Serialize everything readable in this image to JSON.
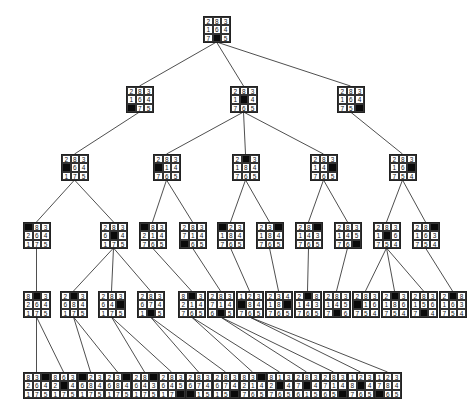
{
  "colors": {
    "blank_tile": "#0a0a0a",
    "line": "#222222",
    "background": "#ffffff"
  },
  "nodes": [
    {
      "id": "r",
      "x": 203,
      "y": 16,
      "tiles": "283164705"
    },
    {
      "id": "a",
      "x": 126,
      "y": 86,
      "tiles": "283164075"
    },
    {
      "id": "b",
      "x": 230,
      "y": 86,
      "tiles": "283104765"
    },
    {
      "id": "c",
      "x": 337,
      "y": 86,
      "tiles": "283164750"
    },
    {
      "id": "a1",
      "x": 61,
      "y": 154,
      "tiles": "283064175"
    },
    {
      "id": "b1",
      "x": 153,
      "y": 154,
      "tiles": "283014765"
    },
    {
      "id": "b2",
      "x": 232,
      "y": 154,
      "tiles": "203184765"
    },
    {
      "id": "b3",
      "x": 310,
      "y": 154,
      "tiles": "283140765"
    },
    {
      "id": "c1",
      "x": 389,
      "y": 154,
      "tiles": "283160754"
    },
    {
      "id": "a1a",
      "x": 23,
      "y": 222,
      "tiles": "083264175"
    },
    {
      "id": "a1b",
      "x": 100,
      "y": 222,
      "tiles": "283604175"
    },
    {
      "id": "b1a",
      "x": 139,
      "y": 222,
      "tiles": "083214765"
    },
    {
      "id": "b1b",
      "x": 179,
      "y": 222,
      "tiles": "283714065"
    },
    {
      "id": "b2a",
      "x": 217,
      "y": 222,
      "tiles": "023184765"
    },
    {
      "id": "b2b",
      "x": 256,
      "y": 222,
      "tiles": "230184765"
    },
    {
      "id": "b3a",
      "x": 295,
      "y": 222,
      "tiles": "280143765"
    },
    {
      "id": "b3b",
      "x": 334,
      "y": 222,
      "tiles": "283145760"
    },
    {
      "id": "c1a",
      "x": 373,
      "y": 222,
      "tiles": "283106754"
    },
    {
      "id": "c1b",
      "x": 412,
      "y": 222,
      "tiles": "280163754"
    },
    {
      "id": "d1",
      "x": 23,
      "y": 291,
      "tiles": "803264175"
    },
    {
      "id": "d2",
      "x": 60,
      "y": 291,
      "tiles": "203684175"
    },
    {
      "id": "d3",
      "x": 98,
      "y": 291,
      "tiles": "283640175"
    },
    {
      "id": "d4",
      "x": 137,
      "y": 291,
      "tiles": "283674105"
    },
    {
      "id": "d5",
      "x": 178,
      "y": 291,
      "tiles": "803214765"
    },
    {
      "id": "d6",
      "x": 207,
      "y": 291,
      "tiles": "283714605"
    },
    {
      "id": "d7",
      "x": 236,
      "y": 291,
      "tiles": "123084765"
    },
    {
      "id": "d8",
      "x": 265,
      "y": 291,
      "tiles": "234180765"
    },
    {
      "id": "d9",
      "x": 294,
      "y": 291,
      "tiles": "208143765"
    },
    {
      "id": "d10",
      "x": 323,
      "y": 291,
      "tiles": "283145706"
    },
    {
      "id": "d11",
      "x": 352,
      "y": 291,
      "tiles": "283016754"
    },
    {
      "id": "d12",
      "x": 381,
      "y": 291,
      "tiles": "203186754"
    },
    {
      "id": "d13",
      "x": 410,
      "y": 291,
      "tiles": "283156704"
    },
    {
      "id": "d14",
      "x": 439,
      "y": 291,
      "tiles": "208163754"
    },
    {
      "id": "e1",
      "x": 23,
      "y": 372,
      "tiles": "830264175"
    },
    {
      "id": "e2",
      "x": 50,
      "y": 372,
      "tiles": "863204175"
    },
    {
      "id": "e3",
      "x": 77,
      "y": 372,
      "tiles": "023684175"
    },
    {
      "id": "e4",
      "x": 104,
      "y": 372,
      "tiles": "230684175"
    },
    {
      "id": "e5",
      "x": 131,
      "y": 372,
      "tiles": "280643175"
    },
    {
      "id": "e6",
      "x": 158,
      "y": 372,
      "tiles": "283645170"
    },
    {
      "id": "e7",
      "x": 185,
      "y": 372,
      "tiles": "283674015"
    },
    {
      "id": "e8",
      "x": 212,
      "y": 372,
      "tiles": "283674150"
    },
    {
      "id": "e9",
      "x": 239,
      "y": 372,
      "tiles": "830214765"
    },
    {
      "id": "e10",
      "x": 266,
      "y": 372,
      "tiles": "813204765"
    },
    {
      "id": "e11",
      "x": 293,
      "y": 372,
      "tiles": "283704615"
    },
    {
      "id": "e12",
      "x": 320,
      "y": 372,
      "tiles": "283714650"
    },
    {
      "id": "e13",
      "x": 347,
      "y": 372,
      "tiles": "123804765"
    },
    {
      "id": "e14",
      "x": 374,
      "y": 372,
      "tiles": "123784065"
    }
  ],
  "edges": [
    [
      "r",
      "a"
    ],
    [
      "r",
      "b"
    ],
    [
      "r",
      "c"
    ],
    [
      "a",
      "a1"
    ],
    [
      "b",
      "b1"
    ],
    [
      "b",
      "b2"
    ],
    [
      "b",
      "b3"
    ],
    [
      "c",
      "c1"
    ],
    [
      "a1",
      "a1a"
    ],
    [
      "a1",
      "a1b"
    ],
    [
      "b1",
      "b1a"
    ],
    [
      "b1",
      "b1b"
    ],
    [
      "b2",
      "b2a"
    ],
    [
      "b2",
      "b2b"
    ],
    [
      "b3",
      "b3a"
    ],
    [
      "b3",
      "b3b"
    ],
    [
      "c1",
      "c1a"
    ],
    [
      "c1",
      "c1b"
    ],
    [
      "a1a",
      "d1"
    ],
    [
      "a1b",
      "d2"
    ],
    [
      "a1b",
      "d3"
    ],
    [
      "a1b",
      "d4"
    ],
    [
      "b1a",
      "d5"
    ],
    [
      "b1b",
      "d6"
    ],
    [
      "b2a",
      "d7"
    ],
    [
      "b2b",
      "d8"
    ],
    [
      "b3a",
      "d9"
    ],
    [
      "b3b",
      "d10"
    ],
    [
      "c1a",
      "d11"
    ],
    [
      "c1a",
      "d12"
    ],
    [
      "c1a",
      "d13"
    ],
    [
      "c1b",
      "d14"
    ],
    [
      "d1",
      "e1"
    ],
    [
      "d1",
      "e2"
    ],
    [
      "d2",
      "e3"
    ],
    [
      "d2",
      "e4"
    ],
    [
      "d3",
      "e5"
    ],
    [
      "d3",
      "e6"
    ],
    [
      "d4",
      "e7"
    ],
    [
      "d4",
      "e8"
    ],
    [
      "d5",
      "e9"
    ],
    [
      "d5",
      "e10"
    ],
    [
      "d6",
      "e11"
    ],
    [
      "d6",
      "e12"
    ],
    [
      "d7",
      "e13"
    ],
    [
      "d7",
      "e14"
    ]
  ]
}
